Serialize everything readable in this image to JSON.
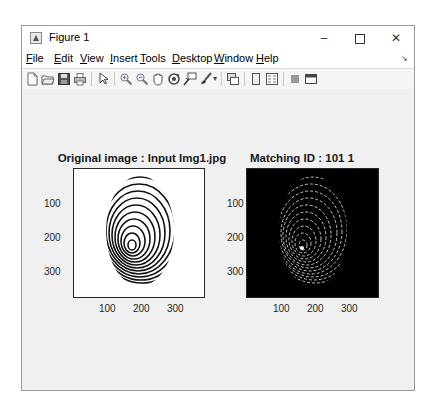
{
  "window": {
    "title": "Figure 1",
    "controls": {
      "minimize": "–",
      "maximize": "□",
      "close": "✕"
    }
  },
  "menubar": {
    "items": [
      {
        "label": "File",
        "accel": "F"
      },
      {
        "label": "Edit",
        "accel": "E"
      },
      {
        "label": "View",
        "accel": "V"
      },
      {
        "label": "Insert",
        "accel": "I"
      },
      {
        "label": "Tools",
        "accel": "T"
      },
      {
        "label": "Desktop",
        "accel": "D"
      },
      {
        "label": "Window",
        "accel": "W"
      },
      {
        "label": "Help",
        "accel": "H"
      }
    ],
    "dock_icon": "dock-arrow-icon"
  },
  "toolbar": {
    "buttons": [
      {
        "icon": "new-figure-icon"
      },
      {
        "icon": "open-file-icon"
      },
      {
        "icon": "save-icon"
      },
      {
        "icon": "print-icon"
      },
      {
        "icon": "edit-plot-pointer-icon"
      },
      {
        "icon": "zoom-in-icon"
      },
      {
        "icon": "zoom-out-icon"
      },
      {
        "icon": "pan-hand-icon"
      },
      {
        "icon": "rotate-3d-icon"
      },
      {
        "icon": "data-cursor-icon"
      },
      {
        "icon": "brush-icon"
      },
      {
        "icon": "link-plot-icon"
      },
      {
        "icon": "hide-plot-tools-icon"
      },
      {
        "icon": "show-plot-tools-icon"
      },
      {
        "icon": "insert-colorbar-icon"
      },
      {
        "icon": "insert-legend-icon"
      }
    ]
  },
  "plots": [
    {
      "title": "Original image : Input Img1.jpg",
      "background": "#ffffff",
      "xticks": [
        "100",
        "200",
        "300"
      ],
      "yticks": [
        "100",
        "200",
        "300"
      ]
    },
    {
      "title": "Matching ID : 101 1",
      "background": "#000000",
      "xticks": [
        "100",
        "200",
        "300"
      ],
      "yticks": [
        "100",
        "200",
        "300"
      ]
    }
  ]
}
